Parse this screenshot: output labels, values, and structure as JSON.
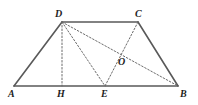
{
  "figure": {
    "name": "trapezoid-geometry-figure",
    "width": 198,
    "height": 105,
    "background_color": "#ffffff",
    "stroke_color_solid": "#595959",
    "stroke_color_dashed": "#6b6b6b",
    "label_color": "#1d1d1d"
  },
  "points": {
    "A": {
      "label": "A",
      "x": 14,
      "y": 86,
      "label_x": 8,
      "label_y": 89
    },
    "B": {
      "label": "B",
      "x": 178,
      "y": 86,
      "label_x": 180,
      "label_y": 89
    },
    "C": {
      "label": "C",
      "x": 138,
      "y": 22,
      "label_x": 135,
      "label_y": 9
    },
    "D": {
      "label": "D",
      "x": 62,
      "y": 22,
      "label_x": 55,
      "label_y": 9
    },
    "E": {
      "label": "E",
      "x": 105,
      "y": 86,
      "label_x": 101,
      "label_y": 89
    },
    "H": {
      "label": "H",
      "x": 62,
      "y": 86,
      "label_x": 57,
      "label_y": 89
    },
    "O": {
      "label": "O",
      "x": 119,
      "y": 57,
      "label_x": 118,
      "label_y": 57
    }
  },
  "segments": [
    {
      "name": "segment-AB",
      "from": "A",
      "to": "B",
      "style": "solid",
      "width": 1.6
    },
    {
      "name": "segment-AD",
      "from": "A",
      "to": "D",
      "style": "solid",
      "width": 1.6
    },
    {
      "name": "segment-DC",
      "from": "D",
      "to": "C",
      "style": "solid",
      "width": 1.6
    },
    {
      "name": "segment-CB",
      "from": "C",
      "to": "B",
      "style": "solid",
      "width": 1.6
    },
    {
      "name": "segment-DH",
      "from": "D",
      "to": "H",
      "style": "dashed",
      "width": 1.0
    },
    {
      "name": "segment-DE",
      "from": "D",
      "to": "E",
      "style": "dashed",
      "width": 1.0
    },
    {
      "name": "segment-DB",
      "from": "D",
      "to": "B",
      "style": "dashed",
      "width": 1.0
    },
    {
      "name": "segment-CE",
      "from": "C",
      "to": "E",
      "style": "dashed",
      "width": 1.0
    }
  ]
}
